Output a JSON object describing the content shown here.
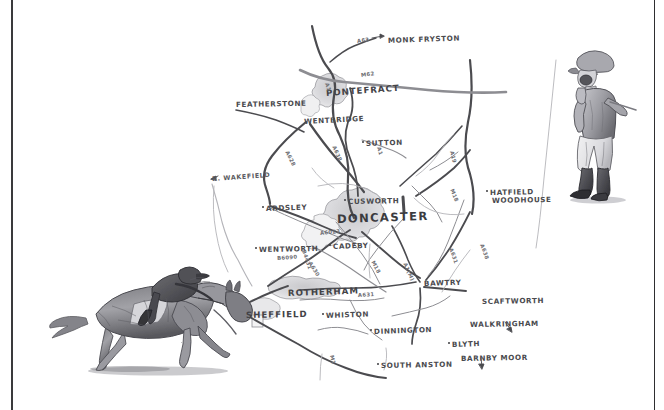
{
  "page": {
    "background_color": "#ffffff",
    "ink_color": "#4a4a4e",
    "border_color": "#3a3a3c",
    "medium": "pencil sketch"
  },
  "illustrations": [
    {
      "name": "galloping-racehorse-and-jockey",
      "description": "Pencil sketch of a racehorse at full gallop ridden by a jockey",
      "position": "lower-left"
    },
    {
      "name": "standing-jockey",
      "description": "Pencil sketch of a jockey standing in silks, breeches and boots holding a whip",
      "position": "upper-right"
    }
  ],
  "map": {
    "towns": [
      {
        "label": "MONK FRYSTON",
        "x": 388,
        "y": 36,
        "size": "town",
        "rot": -2,
        "dot": false
      },
      {
        "label": "PONTEFRACT",
        "x": 326,
        "y": 88,
        "size": "mid",
        "rot": -4,
        "dot": false
      },
      {
        "label": "FEATHERSTONE",
        "x": 236,
        "y": 100,
        "size": "town",
        "rot": -1,
        "dot": false
      },
      {
        "label": "WENTBRIDGE",
        "x": 304,
        "y": 117,
        "size": "town",
        "rot": -3,
        "dot": false
      },
      {
        "label": "SUTTON",
        "x": 366,
        "y": 139,
        "size": "town",
        "rot": -2,
        "dot": true
      },
      {
        "label": "ARDSLEY",
        "x": 266,
        "y": 204,
        "size": "town",
        "rot": -2,
        "dot": true
      },
      {
        "label": "CUSWORTH",
        "x": 348,
        "y": 197,
        "size": "town",
        "rot": -1,
        "dot": true
      },
      {
        "label": "DONCASTER",
        "x": 337,
        "y": 212,
        "size": "big",
        "rot": -2,
        "dot": false
      },
      {
        "label": "HATFIELD",
        "x": 490,
        "y": 188,
        "size": "town",
        "rot": -1,
        "dot": true
      },
      {
        "label": "WOODHOUSE",
        "x": 492,
        "y": 196,
        "size": "town",
        "rot": -1,
        "dot": false
      },
      {
        "label": "WENTWORTH",
        "x": 259,
        "y": 245,
        "size": "town",
        "rot": -1,
        "dot": true
      },
      {
        "label": "CADEBY",
        "x": 333,
        "y": 242,
        "size": "town",
        "rot": -2,
        "dot": true
      },
      {
        "label": "ROTHERHAM",
        "x": 288,
        "y": 288,
        "size": "mid",
        "rot": -2,
        "dot": false
      },
      {
        "label": "SHEFFIELD",
        "x": 246,
        "y": 310,
        "size": "mid",
        "rot": -1,
        "dot": false
      },
      {
        "label": "WHISTON",
        "x": 326,
        "y": 311,
        "size": "town",
        "rot": -2,
        "dot": true
      },
      {
        "label": "BAWTRY",
        "x": 424,
        "y": 279,
        "size": "town",
        "rot": -2,
        "dot": false
      },
      {
        "label": "SCAFTWORTH",
        "x": 482,
        "y": 297,
        "size": "town",
        "rot": -1,
        "dot": false
      },
      {
        "label": "WALKRINGHAM",
        "x": 470,
        "y": 320,
        "size": "town",
        "rot": -1,
        "dot": false
      },
      {
        "label": "DINNINGTON",
        "x": 374,
        "y": 327,
        "size": "town",
        "rot": -2,
        "dot": true
      },
      {
        "label": "BLYTH",
        "x": 452,
        "y": 340,
        "size": "town",
        "rot": -2,
        "dot": true
      },
      {
        "label": "BARNBY MOOR",
        "x": 461,
        "y": 354,
        "size": "town",
        "rot": -1,
        "dot": false
      },
      {
        "label": "SOUTH ANSTON",
        "x": 381,
        "y": 361,
        "size": "town",
        "rot": -1,
        "dot": true
      }
    ],
    "rivers": [
      {
        "label": "R. WAKEFIELD",
        "x": 212,
        "y": 175,
        "rot": -4
      }
    ],
    "roads": [
      {
        "label": "A63",
        "x": 357,
        "y": 38,
        "rot": -8
      },
      {
        "label": "M62",
        "x": 361,
        "y": 72,
        "rot": -8
      },
      {
        "label": "A1",
        "x": 327,
        "y": 80,
        "rot": 72
      },
      {
        "label": "A1",
        "x": 379,
        "y": 144,
        "rot": 74
      },
      {
        "label": "A19",
        "x": 452,
        "y": 148,
        "rot": 76
      },
      {
        "label": "A628",
        "x": 287,
        "y": 148,
        "rot": 64
      },
      {
        "label": "A638",
        "x": 334,
        "y": 143,
        "rot": 66
      },
      {
        "label": "A6023",
        "x": 320,
        "y": 230,
        "rot": -6
      },
      {
        "label": "A630",
        "x": 310,
        "y": 259,
        "rot": 58
      },
      {
        "label": "B6090",
        "x": 277,
        "y": 255,
        "rot": -4
      },
      {
        "label": "B4431",
        "x": 304,
        "y": 247,
        "rot": 72
      },
      {
        "label": "M18",
        "x": 373,
        "y": 258,
        "rot": 62
      },
      {
        "label": "A1(M)",
        "x": 405,
        "y": 260,
        "rot": 66
      },
      {
        "label": "M18",
        "x": 452,
        "y": 186,
        "rot": 68
      },
      {
        "label": "A631",
        "x": 451,
        "y": 245,
        "rot": 70
      },
      {
        "label": "A638",
        "x": 482,
        "y": 241,
        "rot": 70
      },
      {
        "label": "A631",
        "x": 358,
        "y": 292,
        "rot": -3
      },
      {
        "label": "M1",
        "x": 332,
        "y": 352,
        "rot": 78
      }
    ],
    "direction_arrows": [
      {
        "to": "MONK FRYSTON",
        "direction": "east"
      },
      {
        "to": "WAKEFIELD",
        "direction": "west"
      },
      {
        "to": "WALKRINGHAM",
        "direction": "south-east"
      },
      {
        "to": "BARNBY MOOR",
        "direction": "south"
      }
    ]
  }
}
